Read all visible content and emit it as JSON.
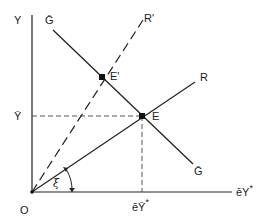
{
  "diagram": {
    "type": "economic-equilibrium-diagram",
    "axes": {
      "y_label": "Y",
      "x_label": "ēY*",
      "x_label_base": "ēY",
      "x_label_sup": "*",
      "origin_label": "O"
    },
    "lines": {
      "g_bar_top_label": "Ḡ",
      "g_bar_bottom_label": "Ḡ",
      "r_label": "R",
      "r_prime_label": "R'"
    },
    "points": {
      "e_label": "E",
      "e_prime_label": "E'"
    },
    "guides": {
      "y_bar_label": "Ȳ",
      "x_tick_label_base": "ēȲ",
      "x_tick_label_sup": "*"
    },
    "angle": {
      "label": "ξ"
    },
    "colors": {
      "ink": "#222222",
      "background": "#ffffff"
    }
  }
}
